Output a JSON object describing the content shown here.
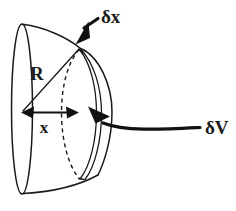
{
  "figure": {
    "type": "geometry-diagram",
    "background_color": "#ffffff",
    "ink_color": "#1a1a1a",
    "labels": {
      "radius": "R",
      "distance": "x",
      "thickness": "δx",
      "volume_element": "δV"
    },
    "annotations": [
      {
        "name": "thickness-label",
        "text": "δx",
        "x": 101,
        "y": 22,
        "leader": "arrow pointing down-left to top edge of disc"
      },
      {
        "name": "volume-element-label",
        "text": "δV",
        "x": 206,
        "y": 130,
        "leader": "curved line with arrow pointing up-left to disc face"
      },
      {
        "name": "radius-label",
        "text": "R",
        "x": 31,
        "y": 79,
        "leader": "line from centre to rim of hemisphere"
      },
      {
        "name": "distance-label",
        "text": "x",
        "x": 44,
        "y": 132,
        "leader": "double-headed horizontal arrow from centre to disc"
      }
    ],
    "geometry": {
      "base_ellipse": {
        "center_x": 22,
        "center_y": 109,
        "radius_x": 10,
        "radius_y": 85
      },
      "dome_apex_x": 110,
      "disc_position_x": 78,
      "disc_thickness_px": 14
    }
  }
}
